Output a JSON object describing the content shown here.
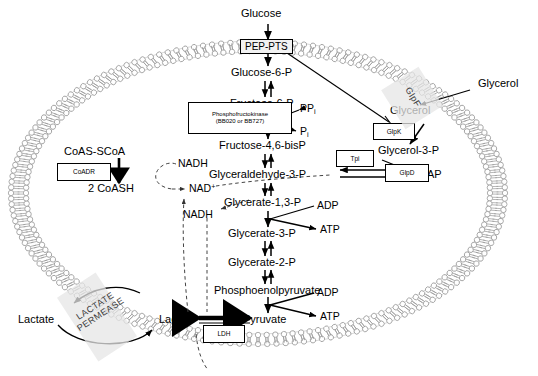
{
  "figure": {
    "type": "pathway-diagram"
  },
  "membrane": {
    "cell_label": "cell-membrane-bilayer",
    "transporters": [
      {
        "name": "PEP-PTS",
        "label": "PEP-PTS"
      },
      {
        "name": "GlpF",
        "label": "GlpF"
      },
      {
        "name": "lactate-permease",
        "line1": "LACTATE",
        "line2": "PERMEASE"
      }
    ]
  },
  "metabolites": {
    "glucose_out": "Glucose",
    "glucose6p": "Glucose-6-P",
    "fructose6p": "Fructose-6-P",
    "fructose16bisp": "Fructose-4,6-bisP",
    "g3p": "Glyceraldehyde-3-P",
    "dhap": "DHAP",
    "glycerate13p": "Glycerate-1,3-P",
    "glycerate3p": "Glycerate-3-P",
    "glycerate2p": "Glycerate-2-P",
    "pep": "Phosphoenolpyruvate",
    "pyruvate": "Pyruvate",
    "lactate_in": "Lactate",
    "lactate_out": "Lactate",
    "glycerol_out": "Glycerol",
    "glycerol_in": "Glycerol",
    "glycerol3p": "Glycerol-3-P",
    "coas_scoa": "CoAS-SCoA",
    "coash": "2 CoASH"
  },
  "cofactors": {
    "ppi": "PP",
    "ppi_sub": "i",
    "pi": "P",
    "pi_sub": "i",
    "adp_1": "ADP",
    "atp_1": "ATP",
    "adp_2": "ADP",
    "atp_2": "ATP",
    "nadh_1": "NADH",
    "nadh_2": "NADH",
    "nad_plus": "NAD",
    "nad_plus_sup": "+"
  },
  "enzymes": [
    {
      "name": "coadr",
      "label": "CoADR"
    },
    {
      "name": "phosphofructokinase",
      "line1": "Phosphofructokinase",
      "line2": "(BB020 or BB727)"
    },
    {
      "name": "tpi",
      "label": "Tpi"
    },
    {
      "name": "glpk",
      "label": "GlpK"
    },
    {
      "name": "glpd",
      "label": "GlpD"
    },
    {
      "name": "ldh",
      "label": "LDH"
    }
  ],
  "colors": {
    "stroke": "#000000",
    "membrane": "#9a9a9a",
    "membrane_fill": "#ffffff",
    "dashed": "#555555",
    "channel_fill": "#e3e3e3"
  }
}
